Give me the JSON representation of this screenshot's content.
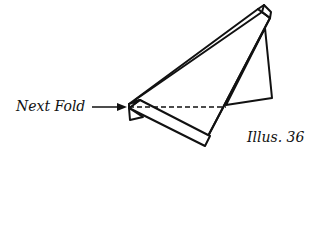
{
  "diagram": {
    "type": "origami-fold-step",
    "labels": {
      "next_fold": "Next Fold",
      "illustration": "Illus. 36"
    },
    "annotations": [
      {
        "text": "Next Fold",
        "points_to": "dashed fold line",
        "style": "arrow"
      }
    ],
    "fold_line": {
      "style": "dashed",
      "orientation": "horizontal"
    },
    "colors": {
      "stroke": "#111111",
      "background": "#ffffff"
    }
  }
}
